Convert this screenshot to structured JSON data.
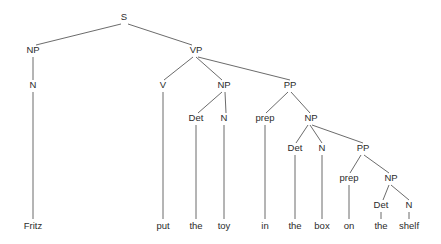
{
  "diagram": {
    "type": "syntax-tree",
    "sentence": "Fritz put the toy in the box on the shelf",
    "line_color": "#5a5a5a",
    "text_color": "#2b2b2b",
    "background_color": "#ffffff",
    "nodes": [
      {
        "id": "s",
        "label": "S",
        "x": 124,
        "y": 20
      },
      {
        "id": "np1",
        "label": "NP",
        "x": 33,
        "y": 53
      },
      {
        "id": "vp",
        "label": "VP",
        "x": 196,
        "y": 53
      },
      {
        "id": "n1",
        "label": "N",
        "x": 33,
        "y": 88
      },
      {
        "id": "v",
        "label": "V",
        "x": 163,
        "y": 88
      },
      {
        "id": "np2",
        "label": "NP",
        "x": 224,
        "y": 88
      },
      {
        "id": "pp1",
        "label": "PP",
        "x": 290,
        "y": 88
      },
      {
        "id": "det1",
        "label": "Det",
        "x": 196,
        "y": 121
      },
      {
        "id": "n2",
        "label": "N",
        "x": 224,
        "y": 121
      },
      {
        "id": "prep1",
        "label": "prep",
        "x": 265,
        "y": 121
      },
      {
        "id": "np3",
        "label": "NP",
        "x": 311,
        "y": 121
      },
      {
        "id": "det2",
        "label": "Det",
        "x": 295,
        "y": 151
      },
      {
        "id": "n3",
        "label": "N",
        "x": 322,
        "y": 151
      },
      {
        "id": "pp2",
        "label": "PP",
        "x": 363,
        "y": 151
      },
      {
        "id": "prep2",
        "label": "prep",
        "x": 349,
        "y": 181
      },
      {
        "id": "np4",
        "label": "NP",
        "x": 391,
        "y": 181
      },
      {
        "id": "det3",
        "label": "Det",
        "x": 381,
        "y": 208
      },
      {
        "id": "n4",
        "label": "N",
        "x": 409,
        "y": 208
      }
    ],
    "leaves": [
      {
        "id": "leaf-fritz",
        "label": "Fritz",
        "x": 33,
        "y": 229
      },
      {
        "id": "leaf-put",
        "label": "put",
        "x": 163,
        "y": 229
      },
      {
        "id": "leaf-the1",
        "label": "the",
        "x": 196,
        "y": 229
      },
      {
        "id": "leaf-toy",
        "label": "toy",
        "x": 224,
        "y": 229
      },
      {
        "id": "leaf-in",
        "label": "in",
        "x": 265,
        "y": 229
      },
      {
        "id": "leaf-the2",
        "label": "the",
        "x": 295,
        "y": 229
      },
      {
        "id": "leaf-box",
        "label": "box",
        "x": 322,
        "y": 229
      },
      {
        "id": "leaf-on",
        "label": "on",
        "x": 349,
        "y": 229
      },
      {
        "id": "leaf-the3",
        "label": "the",
        "x": 381,
        "y": 229
      },
      {
        "id": "leaf-shelf",
        "label": "shelf",
        "x": 409,
        "y": 229
      }
    ],
    "edges": [
      {
        "id": "edge-s-np1",
        "x1": 121,
        "y1": 24,
        "x2": 36,
        "y2": 45
      },
      {
        "id": "edge-s-vp",
        "x1": 128,
        "y1": 24,
        "x2": 192,
        "y2": 45
      },
      {
        "id": "edge-np1-n1",
        "x1": 33,
        "y1": 57,
        "x2": 33,
        "y2": 80
      },
      {
        "id": "edge-n1-fritz",
        "x1": 33,
        "y1": 92,
        "x2": 33,
        "y2": 219
      },
      {
        "id": "edge-vp-v",
        "x1": 193,
        "y1": 57,
        "x2": 164,
        "y2": 80
      },
      {
        "id": "edge-vp-np2",
        "x1": 196,
        "y1": 57,
        "x2": 222,
        "y2": 80
      },
      {
        "id": "edge-vp-pp1",
        "x1": 198,
        "y1": 57,
        "x2": 290,
        "y2": 80
      },
      {
        "id": "edge-v-put",
        "x1": 163,
        "y1": 92,
        "x2": 163,
        "y2": 219
      },
      {
        "id": "edge-np2-det1",
        "x1": 222,
        "y1": 92,
        "x2": 198,
        "y2": 113
      },
      {
        "id": "edge-np2-n2",
        "x1": 225,
        "y1": 92,
        "x2": 226,
        "y2": 113
      },
      {
        "id": "edge-det1-the1",
        "x1": 196,
        "y1": 125,
        "x2": 196,
        "y2": 219
      },
      {
        "id": "edge-n2-toy",
        "x1": 224,
        "y1": 125,
        "x2": 224,
        "y2": 219
      },
      {
        "id": "edge-pp1-prep1",
        "x1": 288,
        "y1": 92,
        "x2": 266,
        "y2": 113
      },
      {
        "id": "edge-pp1-np3",
        "x1": 291,
        "y1": 92,
        "x2": 310,
        "y2": 113
      },
      {
        "id": "edge-prep1-in",
        "x1": 265,
        "y1": 125,
        "x2": 265,
        "y2": 219
      },
      {
        "id": "edge-np3-det2",
        "x1": 308,
        "y1": 125,
        "x2": 296,
        "y2": 143
      },
      {
        "id": "edge-np3-n3",
        "x1": 310,
        "y1": 125,
        "x2": 322,
        "y2": 143
      },
      {
        "id": "edge-np3-pp2",
        "x1": 312,
        "y1": 125,
        "x2": 363,
        "y2": 143
      },
      {
        "id": "edge-det2-the2",
        "x1": 295,
        "y1": 155,
        "x2": 295,
        "y2": 219
      },
      {
        "id": "edge-n3-box",
        "x1": 322,
        "y1": 155,
        "x2": 322,
        "y2": 219
      },
      {
        "id": "edge-pp2-prep2",
        "x1": 361,
        "y1": 155,
        "x2": 350,
        "y2": 173
      },
      {
        "id": "edge-pp2-np4",
        "x1": 364,
        "y1": 155,
        "x2": 389,
        "y2": 173
      },
      {
        "id": "edge-prep2-on",
        "x1": 349,
        "y1": 185,
        "x2": 349,
        "y2": 219
      },
      {
        "id": "edge-np4-det3",
        "x1": 389,
        "y1": 185,
        "x2": 383,
        "y2": 200
      },
      {
        "id": "edge-np4-n4",
        "x1": 391,
        "y1": 185,
        "x2": 409,
        "y2": 200
      },
      {
        "id": "edge-det3-the3",
        "x1": 381,
        "y1": 212,
        "x2": 381,
        "y2": 219
      },
      {
        "id": "edge-n4-shelf",
        "x1": 409,
        "y1": 212,
        "x2": 409,
        "y2": 219
      }
    ]
  }
}
